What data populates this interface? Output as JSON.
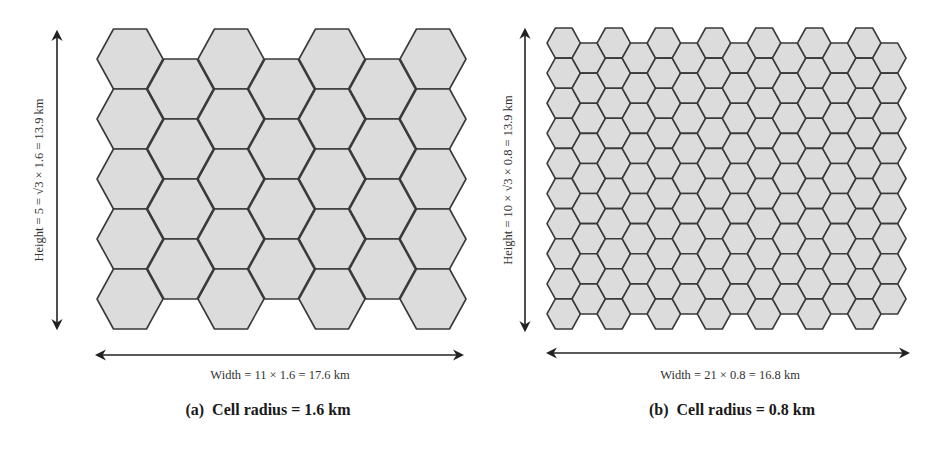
{
  "panels": [
    {
      "id": "a",
      "caption": "(a)  Cell radius = 1.6 km",
      "height_label": "Height = 5 = √3 × 1.6 = 13.9 km",
      "width_label": "Width = 11 × 1.6 = 17.6 km",
      "cell_radius_km": 1.6,
      "grid": {
        "columns": 7,
        "rows_tall_columns": 5,
        "rows_short_columns": 4
      },
      "layout": {
        "x0": 97,
        "y0": 29,
        "R": 33,
        "h": 60,
        "step": 50.5
      },
      "height_arrow": {
        "x": 57,
        "y1": 32,
        "y2": 328
      },
      "width_arrow": {
        "y": 355,
        "x1": 97,
        "x2": 462
      },
      "height_label_pos": {
        "x": 43,
        "y": 180
      },
      "width_label_pos": {
        "x": 280,
        "y": 379
      },
      "caption_pos": {
        "x": 268,
        "y": 415
      }
    },
    {
      "id": "b",
      "caption": "(b)  Cell radius = 0.8 km",
      "height_label": "Height = 10 × √3 × 0.8 = 13.9 km",
      "width_label": "Width = 21 × 0.8 = 16.8 km",
      "cell_radius_km": 0.8,
      "grid": {
        "columns": 14,
        "rows_tall_columns": 10,
        "rows_short_columns": 9
      },
      "layout": {
        "x0": 547,
        "y0": 28,
        "R": 16.7,
        "h": 30.1,
        "step": 25.05
      },
      "height_arrow": {
        "x": 525,
        "y1": 30,
        "y2": 330
      },
      "width_arrow": {
        "y": 353,
        "x1": 548,
        "x2": 908
      },
      "height_label_pos": {
        "x": 512,
        "y": 180
      },
      "width_label_pos": {
        "x": 730,
        "y": 379
      },
      "caption_pos": {
        "x": 732,
        "y": 415
      }
    }
  ],
  "style": {
    "hex_fill": "#dcdcdc",
    "hex_stroke": "#3a3a3a"
  }
}
